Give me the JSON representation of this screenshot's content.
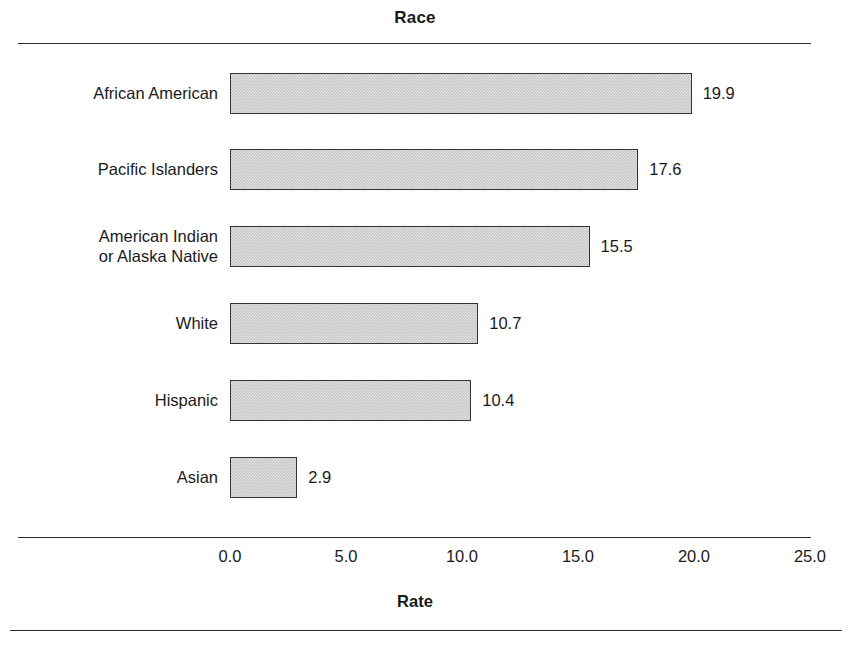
{
  "chart_data": {
    "type": "bar",
    "orientation": "horizontal",
    "title": "Race",
    "xlabel": "Rate",
    "ylabel": "",
    "categories": [
      "African American",
      "Pacific Islanders",
      "American Indian\nor Alaska Native",
      "White",
      "Hispanic",
      "Asian"
    ],
    "values": [
      19.9,
      17.6,
      15.5,
      10.7,
      10.4,
      2.9
    ],
    "value_labels": [
      "19.9",
      "17.6",
      "15.5",
      "10.7",
      "10.4",
      "2.9"
    ],
    "xlim": [
      0.0,
      25.0
    ],
    "xticks": [
      0.0,
      5.0,
      10.0,
      15.0,
      20.0,
      25.0
    ],
    "xtick_labels": [
      "0.0",
      "5.0",
      "10.0",
      "15.0",
      "20.0",
      "25.0"
    ],
    "grid": false,
    "legend": false,
    "bar_fill": "#c6c6c6",
    "bar_border": "#333333"
  }
}
